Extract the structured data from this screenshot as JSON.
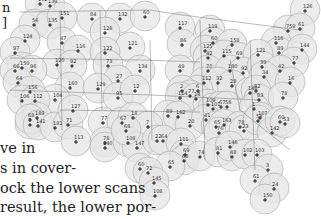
{
  "body_text": {
    "top_fragments": [
      "n",
      "]"
    ],
    "lines": [
      "ve in",
      "s in cover-",
      "ock the lower scans",
      "result, the lower por-"
    ]
  },
  "map": {
    "title": "",
    "stations": [
      {
        "label": "139",
        "x": 50,
        "y": 3
      },
      {
        "label": "102",
        "x": 40,
        "y": 1
      },
      {
        "label": "56",
        "x": 34,
        "y": 22
      },
      {
        "label": "135",
        "x": 50,
        "y": 22
      },
      {
        "label": "151",
        "x": 62,
        "y": 15
      },
      {
        "label": "84",
        "x": 92,
        "y": 16
      },
      {
        "label": "132",
        "x": 120,
        "y": 16
      },
      {
        "label": "60",
        "x": 145,
        "y": 14
      },
      {
        "label": "124",
        "x": 25,
        "y": 38
      },
      {
        "label": "47",
        "x": 62,
        "y": 40
      },
      {
        "label": "116",
        "x": 78,
        "y": 48
      },
      {
        "label": "128",
        "x": 105,
        "y": 30
      },
      {
        "label": "121",
        "x": 130,
        "y": 45
      },
      {
        "label": "122",
        "x": 105,
        "y": 50
      },
      {
        "label": "97",
        "x": 15,
        "y": 50
      },
      {
        "label": "120",
        "x": 57,
        "y": 62
      },
      {
        "label": "92",
        "x": 72,
        "y": 63
      },
      {
        "label": "73",
        "x": 108,
        "y": 63
      },
      {
        "label": "134",
        "x": 140,
        "y": 68
      },
      {
        "label": "27",
        "x": 118,
        "y": 78
      },
      {
        "label": "150",
        "x": 22,
        "y": 65
      },
      {
        "label": "66",
        "x": 15,
        "y": 68
      },
      {
        "label": "96",
        "x": 32,
        "y": 68
      },
      {
        "label": "64",
        "x": 18,
        "y": 80
      },
      {
        "label": "160",
        "x": 70,
        "y": 85
      },
      {
        "label": "129",
        "x": 98,
        "y": 86
      },
      {
        "label": "95",
        "x": 118,
        "y": 95
      },
      {
        "label": "12",
        "x": 135,
        "y": 88
      },
      {
        "label": "156",
        "x": 30,
        "y": 89
      },
      {
        "label": "104",
        "x": 55,
        "y": 97
      },
      {
        "label": "106",
        "x": 22,
        "y": 98
      },
      {
        "label": "112",
        "x": 35,
        "y": 98
      },
      {
        "label": "117",
        "x": 180,
        "y": 25
      },
      {
        "label": "119",
        "x": 210,
        "y": 28
      },
      {
        "label": "126",
        "x": 305,
        "y": 8
      },
      {
        "label": "759",
        "x": 288,
        "y": 28
      },
      {
        "label": "61",
        "x": 300,
        "y": 26
      },
      {
        "label": "86",
        "x": 182,
        "y": 42
      },
      {
        "label": "60",
        "x": 213,
        "y": 40
      },
      {
        "label": "158",
        "x": 232,
        "y": 42
      },
      {
        "label": "125",
        "x": 205,
        "y": 48
      },
      {
        "label": "42",
        "x": 208,
        "y": 55
      },
      {
        "label": "115",
        "x": 224,
        "y": 53
      },
      {
        "label": "69",
        "x": 238,
        "y": 55
      },
      {
        "label": "116",
        "x": 276,
        "y": 40
      },
      {
        "label": "89",
        "x": 279,
        "y": 50
      },
      {
        "label": "144",
        "x": 302,
        "y": 47
      },
      {
        "label": "121",
        "x": 258,
        "y": 52
      },
      {
        "label": "77",
        "x": 294,
        "y": 60
      },
      {
        "label": "49",
        "x": 180,
        "y": 68
      },
      {
        "label": "70",
        "x": 208,
        "y": 68
      },
      {
        "label": "180",
        "x": 230,
        "y": 68
      },
      {
        "label": "92",
        "x": 243,
        "y": 70
      },
      {
        "label": "39",
        "x": 262,
        "y": 64
      },
      {
        "label": "42",
        "x": 280,
        "y": 68
      },
      {
        "label": "34",
        "x": 264,
        "y": 74
      },
      {
        "label": "112",
        "x": 204,
        "y": 80
      },
      {
        "label": "32",
        "x": 218,
        "y": 80
      },
      {
        "label": "16",
        "x": 290,
        "y": 80
      },
      {
        "label": "6",
        "x": 198,
        "y": 88
      },
      {
        "label": "28",
        "x": 232,
        "y": 83
      },
      {
        "label": "2",
        "x": 182,
        "y": 88
      },
      {
        "label": "77",
        "x": 190,
        "y": 93
      },
      {
        "label": "114",
        "x": 180,
        "y": 95
      },
      {
        "label": "14",
        "x": 196,
        "y": 96
      },
      {
        "label": "148",
        "x": 250,
        "y": 90
      },
      {
        "label": "82",
        "x": 256,
        "y": 88
      },
      {
        "label": "83",
        "x": 259,
        "y": 97
      },
      {
        "label": "78",
        "x": 283,
        "y": 95
      },
      {
        "label": "109",
        "x": 208,
        "y": 102
      },
      {
        "label": "101",
        "x": 213,
        "y": 106
      },
      {
        "label": "67",
        "x": 221,
        "y": 104
      },
      {
        "label": "58",
        "x": 227,
        "y": 104
      },
      {
        "label": "1",
        "x": 254,
        "y": 106
      },
      {
        "label": "89",
        "x": 168,
        "y": 113
      },
      {
        "label": "162",
        "x": 178,
        "y": 114
      },
      {
        "label": "20",
        "x": 190,
        "y": 123
      },
      {
        "label": "41",
        "x": 206,
        "y": 117
      },
      {
        "label": "65",
        "x": 216,
        "y": 124
      },
      {
        "label": "163",
        "x": 224,
        "y": 122
      },
      {
        "label": "76",
        "x": 219,
        "y": 130
      },
      {
        "label": "78",
        "x": 240,
        "y": 124
      },
      {
        "label": "23",
        "x": 244,
        "y": 128
      },
      {
        "label": "107",
        "x": 260,
        "y": 115
      },
      {
        "label": "58",
        "x": 258,
        "y": 118
      },
      {
        "label": "142",
        "x": 272,
        "y": 130
      },
      {
        "label": "60",
        "x": 280,
        "y": 119
      },
      {
        "label": "53",
        "x": 285,
        "y": 121
      },
      {
        "label": "77",
        "x": 103,
        "y": 120
      },
      {
        "label": "67",
        "x": 122,
        "y": 120
      },
      {
        "label": "18",
        "x": 133,
        "y": 115
      },
      {
        "label": "7",
        "x": 148,
        "y": 124
      },
      {
        "label": "7",
        "x": 30,
        "y": 122
      },
      {
        "label": "189",
        "x": 37,
        "y": 115
      },
      {
        "label": "68",
        "x": 30,
        "y": 117
      },
      {
        "label": "141",
        "x": 38,
        "y": 123
      },
      {
        "label": "181",
        "x": 55,
        "y": 125
      },
      {
        "label": "71",
        "x": 68,
        "y": 122
      },
      {
        "label": "127",
        "x": 73,
        "y": 108
      },
      {
        "label": "113",
        "x": 76,
        "y": 139
      },
      {
        "label": "78",
        "x": 105,
        "y": 140
      },
      {
        "label": "140",
        "x": 105,
        "y": 145
      },
      {
        "label": "108",
        "x": 128,
        "y": 140
      },
      {
        "label": "147",
        "x": 137,
        "y": 145
      },
      {
        "label": "68",
        "x": 126,
        "y": 128
      },
      {
        "label": "22",
        "x": 157,
        "y": 138
      },
      {
        "label": "64",
        "x": 163,
        "y": 138
      },
      {
        "label": "111",
        "x": 181,
        "y": 141
      },
      {
        "label": "69",
        "x": 185,
        "y": 152
      },
      {
        "label": "68",
        "x": 184,
        "y": 158
      },
      {
        "label": "65",
        "x": 170,
        "y": 164
      },
      {
        "label": "60",
        "x": 140,
        "y": 166
      },
      {
        "label": "72",
        "x": 148,
        "y": 170
      },
      {
        "label": "145",
        "x": 154,
        "y": 180
      },
      {
        "label": "108",
        "x": 155,
        "y": 193
      },
      {
        "label": "74",
        "x": 200,
        "y": 154
      },
      {
        "label": "81",
        "x": 218,
        "y": 150
      },
      {
        "label": "48",
        "x": 232,
        "y": 154
      },
      {
        "label": "146",
        "x": 230,
        "y": 144
      },
      {
        "label": "102",
        "x": 245,
        "y": 152
      },
      {
        "label": "103",
        "x": 257,
        "y": 152
      },
      {
        "label": "3",
        "x": 268,
        "y": 167
      },
      {
        "label": "61",
        "x": 255,
        "y": 178
      },
      {
        "label": "24",
        "x": 274,
        "y": 186
      },
      {
        "label": "150",
        "x": 265,
        "y": 197
      }
    ]
  }
}
